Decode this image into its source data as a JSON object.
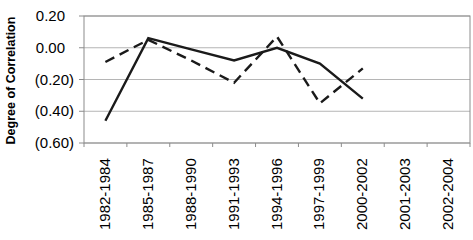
{
  "chart_data": {
    "type": "line",
    "ylabel": "Degree of Correlation",
    "categories": [
      "1982-1984",
      "1985-1987",
      "1988-1990",
      "1991-1993",
      "1994-1996",
      "1997-1999",
      "2000-2002",
      "2001-2003",
      "2002-2004"
    ],
    "series": [
      {
        "name": "solid-line-series",
        "line_style": "solid",
        "values": [
          -0.46,
          0.06,
          -0.01,
          -0.08,
          0.0,
          -0.1,
          -0.32,
          null,
          null
        ]
      },
      {
        "name": "dashed-line-series",
        "line_style": "dashed",
        "values": [
          -0.09,
          0.05,
          -0.08,
          -0.22,
          0.07,
          -0.35,
          -0.13,
          null,
          null
        ]
      }
    ],
    "ylim": [
      -0.6,
      0.2
    ],
    "ytick_step": 0.2,
    "ytick_labels": [
      "0.20",
      "0.00",
      "(0.20)",
      "(0.40)",
      "(0.60)"
    ],
    "negative_format": "parentheses",
    "grid": true,
    "legend_position": "none",
    "colors": {
      "series": "#1a1a1a",
      "grid": "#b5b5b5",
      "axis": "#8c8c8c",
      "background": "#ffffff",
      "text": "#000000"
    }
  }
}
